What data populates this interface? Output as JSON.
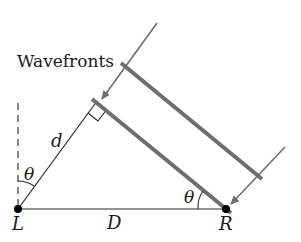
{
  "diagram": {
    "title_label": "Wavefronts",
    "points": {
      "L": "L",
      "R": "R"
    },
    "labels": {
      "d": "d",
      "D": "D",
      "theta_left": "θ",
      "theta_right": "θ"
    },
    "colors": {
      "wavefront": "#6e6e6e",
      "arrow": "#6e6e6e",
      "line": "#2a2a2a",
      "point": "#000000"
    }
  }
}
